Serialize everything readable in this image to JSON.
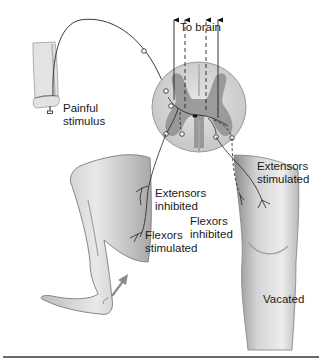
{
  "diagram": {
    "topic": "Crossed extensor reflex",
    "labels": {
      "to_brain": "To brain",
      "painful_stimulus": [
        "Painful",
        "stimulus"
      ],
      "extensors_stimulated": [
        "Extensors",
        "stimulated"
      ],
      "extensors_inhibited": [
        "Extensors",
        "inhibited"
      ],
      "flexors_inhibited": [
        "Flexors",
        "inhibited"
      ],
      "flexors_stimulated": [
        "Flexors",
        "stimulated"
      ],
      "vacated": "Vacated"
    },
    "structures": [
      "foot-with-stimulus",
      "spinal-cord-cross-section",
      "ascending-pathways-to-brain",
      "flexed-left-leg",
      "extended-right-leg",
      "withdrawal-arrow"
    ],
    "colors": {
      "cord_white_matter": "#d9d9d9",
      "cord_gray_matter": "#8f8f8f",
      "skin_light": "#e6e6e6",
      "skin_shade": "#a9a9a9",
      "nerve_line": "#1a1a1a",
      "arrow_gray": "#8c8c8c",
      "rule": "#6a6a6a"
    }
  }
}
